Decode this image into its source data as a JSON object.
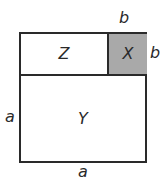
{
  "diagram": {
    "regions": {
      "z": {
        "label": "Z",
        "fill": "#ffffff"
      },
      "x": {
        "label": "X",
        "fill": "#a9a9a9"
      },
      "y": {
        "label": "Y",
        "fill": "#ffffff"
      }
    },
    "dimensions": {
      "top": "b",
      "right": "b",
      "left": "a",
      "bottom": "a"
    }
  }
}
